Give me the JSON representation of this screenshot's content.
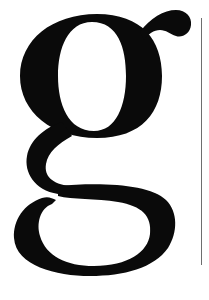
{
  "glyph": {
    "character": "g",
    "color": "#0a0a0a",
    "background": "#ffffff"
  },
  "vertical_line": {
    "color": "#6e6e6e"
  }
}
